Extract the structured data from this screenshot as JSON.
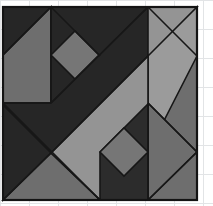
{
  "canvas": {
    "width": 213,
    "height": 206,
    "background_color": "#ffffff",
    "title": "Geometric Quilt Block"
  },
  "grid": {
    "visible": true,
    "line_color": "#e2e4e6",
    "spacing_px": 29,
    "x_lines": [
      0,
      29,
      58,
      87,
      116,
      145,
      174,
      203
    ],
    "y_lines": [
      0,
      29,
      58,
      87,
      116,
      145,
      174,
      203
    ]
  },
  "palette": {
    "dark": "#262626",
    "dark_alt": "#2c2c2c",
    "medium": "#6e6e6e",
    "medium_alt": "#767676",
    "light": "#949494",
    "light_alt": "#9b9b9b",
    "outline": "#171717",
    "frame": "#141414"
  },
  "block": {
    "name": "quilt-block",
    "bounds": {
      "x": 3,
      "y": 7,
      "width": 194,
      "height": 193
    },
    "description": "Pieced quilt block with a broad dark diagonal band running corner to corner, two on-point square-in-a-square motifs, and flanking triangles in three grayscale tones."
  },
  "patches": [
    {
      "id": "p01",
      "name": "patch-top-left-dark-triangle",
      "tone": "dark",
      "fill": "#262626",
      "points": "3,7 51,7 3,55"
    },
    {
      "id": "p02",
      "name": "patch-left-upper-medium-triangle",
      "tone": "medium",
      "fill": "#6e6e6e",
      "points": "3,55 51,7 51,103 3,103"
    },
    {
      "id": "p03",
      "name": "patch-top-center-dark-triangle",
      "tone": "dark",
      "fill": "#2c2c2c",
      "points": "51,7 100,7 51,56"
    },
    {
      "id": "p04",
      "name": "patch-upper-diamond-dark-field",
      "tone": "dark",
      "fill": "#262626",
      "points": "51,7 100,7 148,7 148,56 100,103 51,103 51,56"
    },
    {
      "id": "p05",
      "name": "patch-upper-center-diamond",
      "tone": "medium",
      "fill": "#767676",
      "points": "51,55 75,31 99,55 75,79"
    },
    {
      "id": "p06",
      "name": "patch-diagonal-band-dark",
      "tone": "dark",
      "fill": "#262626",
      "points": "3,103 51,103 148,7 197,7 51,153 3,105"
    },
    {
      "id": "p07",
      "name": "patch-right-upper-light-band",
      "tone": "light",
      "fill": "#949494",
      "points": "148,7 197,7 197,56 148,56"
    },
    {
      "id": "p08",
      "name": "patch-right-light-diagonal-strip",
      "tone": "light",
      "fill": "#9b9b9b",
      "points": "197,7 197,103 148,152 148,56"
    },
    {
      "id": "p09",
      "name": "patch-right-edge-medium-triangle",
      "tone": "medium",
      "fill": "#6e6e6e",
      "points": "197,56 197,152 148,152"
    },
    {
      "id": "p10",
      "name": "patch-right-lower-medium-field",
      "tone": "medium",
      "fill": "#6e6e6e",
      "points": "148,103 197,152 197,200 148,200"
    },
    {
      "id": "p11",
      "name": "patch-center-light-chevron",
      "tone": "light",
      "fill": "#949494",
      "points": "51,153 148,56 148,152 100,200 51,200"
    },
    {
      "id": "p12",
      "name": "patch-lower-diamond-dark-field",
      "tone": "dark",
      "fill": "#2c2c2c",
      "points": "100,152 148,104 148,200 100,200"
    },
    {
      "id": "p13",
      "name": "patch-lower-center-diamond",
      "tone": "medium",
      "fill": "#767676",
      "points": "100,152 124,128 148,152 124,176"
    },
    {
      "id": "p14",
      "name": "patch-bottom-left-dark-triangle",
      "tone": "dark",
      "fill": "#262626",
      "points": "3,105 51,153 3,200"
    },
    {
      "id": "p15",
      "name": "patch-bottom-left-medium-triangle",
      "tone": "medium",
      "fill": "#6e6e6e",
      "points": "3,200 51,153 100,200"
    },
    {
      "id": "p16",
      "name": "patch-bottom-right-medium-wedge",
      "tone": "medium",
      "fill": "#6e6e6e",
      "points": "148,200 197,152 197,200"
    }
  ],
  "seams": [
    {
      "id": "s1",
      "name": "seam-vertical-left",
      "x1": 51,
      "y1": 7,
      "x2": 51,
      "y2": 103
    },
    {
      "id": "s2",
      "name": "seam-vertical-right",
      "x1": 148,
      "y1": 104,
      "x2": 148,
      "y2": 200
    },
    {
      "id": "s3",
      "name": "seam-upper-diagonal-left",
      "x1": 3,
      "y1": 55,
      "x2": 51,
      "y2": 7
    },
    {
      "id": "s4",
      "name": "seam-upper-diagonal-right",
      "x1": 51,
      "y1": 7,
      "x2": 100,
      "y2": 56
    },
    {
      "id": "s5",
      "name": "seam-horizontal-mid-left",
      "x1": 3,
      "y1": 103,
      "x2": 51,
      "y2": 103
    },
    {
      "id": "s6",
      "name": "seam-lower-diagonal-left",
      "x1": 3,
      "y1": 200,
      "x2": 51,
      "y2": 153
    },
    {
      "id": "s7",
      "name": "seam-lower-diagonal-right",
      "x1": 51,
      "y1": 153,
      "x2": 100,
      "y2": 200
    },
    {
      "id": "s8",
      "name": "seam-right-diagonal-upper",
      "x1": 148,
      "y1": 7,
      "x2": 197,
      "y2": 56
    },
    {
      "id": "s9",
      "name": "seam-right-diagonal-lower",
      "x1": 148,
      "y1": 103,
      "x2": 197,
      "y2": 152
    },
    {
      "id": "s10",
      "name": "seam-bottom-right-diagonal",
      "x1": 148,
      "y1": 200,
      "x2": 197,
      "y2": 152
    },
    {
      "id": "s11",
      "name": "seam-band-upper-edge",
      "x1": 51,
      "y1": 103,
      "x2": 148,
      "y2": 7
    },
    {
      "id": "s12",
      "name": "seam-band-lower-edge",
      "x1": 3,
      "y1": 103,
      "x2": 100,
      "y2": 200
    },
    {
      "id": "s13",
      "name": "seam-center-light-edge",
      "x1": 51,
      "y1": 153,
      "x2": 148,
      "y2": 56
    }
  ]
}
